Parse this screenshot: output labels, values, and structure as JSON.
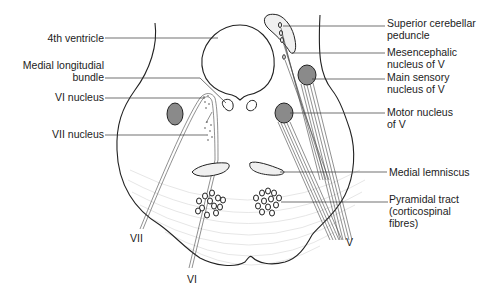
{
  "diagram": {
    "labels_left": [
      {
        "id": "fourth-ventricle",
        "text": "4th ventricle"
      },
      {
        "id": "mlf",
        "line1": "Medial longitudial",
        "line2": "bundle"
      },
      {
        "id": "vi-nucleus",
        "text": "VI nucleus"
      },
      {
        "id": "vii-nucleus",
        "text": "VII nucleus"
      }
    ],
    "labels_right": [
      {
        "id": "scp",
        "line1": "Superior cerebellar",
        "line2": "peduncle"
      },
      {
        "id": "mesencephalic",
        "line1": "Mesencephalic",
        "line2": "nucleus of V"
      },
      {
        "id": "main-sensory",
        "line1": "Main sensory",
        "line2": "nucleus of V"
      },
      {
        "id": "motor-v",
        "line1": "Motor nucleus",
        "line2": "of V"
      },
      {
        "id": "medial-lemniscus",
        "text": "Medial lemniscus"
      },
      {
        "id": "pyramidal",
        "line1": "Pyramidal tract",
        "line2": "(corticospinal",
        "line3": "fibres)"
      }
    ],
    "nerve_labels": {
      "vii": "VII",
      "vi": "VI",
      "v": "V"
    },
    "colors": {
      "outline": "#222222",
      "nucleus_fill": "#8a8a8a",
      "background": "#ffffff"
    }
  }
}
